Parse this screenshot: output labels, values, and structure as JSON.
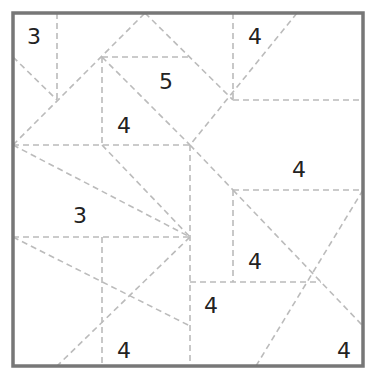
{
  "puzzle": {
    "type": "area-division puzzle",
    "border_color": "#777777",
    "line_color": "#bbbbbb",
    "clues": [
      {
        "value": "3",
        "x": 34,
        "y": 37
      },
      {
        "value": "4",
        "x": 255,
        "y": 37
      },
      {
        "value": "5",
        "x": 166,
        "y": 82
      },
      {
        "value": "4",
        "x": 124,
        "y": 126
      },
      {
        "value": "4",
        "x": 299,
        "y": 170
      },
      {
        "value": "3",
        "x": 80,
        "y": 216
      },
      {
        "value": "4",
        "x": 255,
        "y": 262
      },
      {
        "value": "4",
        "x": 211,
        "y": 306
      },
      {
        "value": "4",
        "x": 124,
        "y": 351
      },
      {
        "value": "4",
        "x": 344,
        "y": 351
      }
    ],
    "lines": [
      [
        57,
        13,
        57,
        100
      ],
      [
        13,
        57,
        57,
        100
      ],
      [
        13,
        145,
        145,
        13
      ],
      [
        102,
        57,
        190,
        57
      ],
      [
        145,
        13,
        233,
        100
      ],
      [
        102,
        57,
        190,
        145
      ],
      [
        190,
        145,
        233,
        190
      ],
      [
        233,
        190,
        363,
        326
      ],
      [
        233,
        13,
        233,
        100
      ],
      [
        233,
        100,
        363,
        100
      ],
      [
        297,
        13,
        190,
        145
      ],
      [
        102,
        57,
        102,
        145
      ],
      [
        13,
        145,
        190,
        145
      ],
      [
        13,
        145,
        190,
        237
      ],
      [
        102,
        145,
        190,
        237
      ],
      [
        190,
        145,
        190,
        366
      ],
      [
        13,
        237,
        190,
        237
      ],
      [
        102,
        237,
        102,
        366
      ],
      [
        13,
        237,
        190,
        326
      ],
      [
        190,
        237,
        57,
        366
      ],
      [
        233,
        190,
        233,
        282
      ],
      [
        233,
        190,
        363,
        190
      ],
      [
        190,
        282,
        321,
        282
      ],
      [
        363,
        190,
        256,
        366
      ]
    ]
  }
}
